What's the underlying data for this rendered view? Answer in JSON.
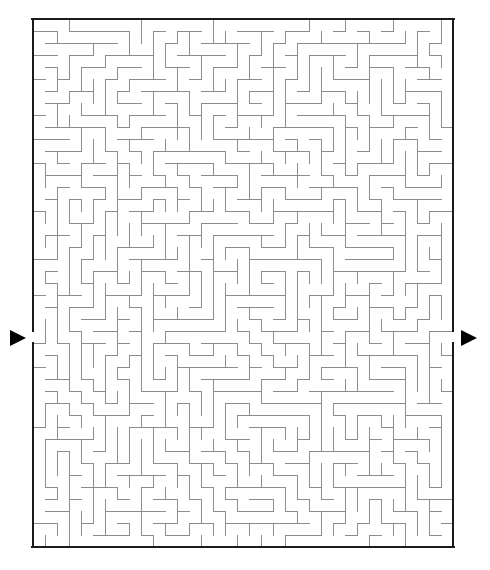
{
  "puzzle": {
    "type": "maze",
    "title": "",
    "background_color": "#ffffff"
  },
  "maze": {
    "columns": 35,
    "rows": 44,
    "cell_size": 12,
    "origin_x": 33,
    "origin_y": 19,
    "width_px": 420,
    "height_px": 528,
    "wall_color": "#8c8c8c",
    "wall_thickness": 1,
    "border_color": "#1a1a1a",
    "border_thickness": 2,
    "seed": 20240517
  },
  "entrance": {
    "label": "entrance",
    "side": "left",
    "row": 26,
    "arrow_color": "#000000",
    "arrow_direction": "right",
    "arrow_x": 10,
    "arrow_y": 330,
    "arrow_width": 16,
    "arrow_height": 16
  },
  "exit": {
    "label": "exit",
    "side": "right",
    "row": 26,
    "arrow_color": "#000000",
    "arrow_direction": "right",
    "arrow_x": 461,
    "arrow_y": 330,
    "arrow_width": 16,
    "arrow_height": 16
  }
}
